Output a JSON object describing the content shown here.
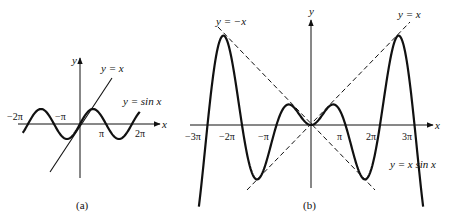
{
  "figure": {
    "panels": [
      {
        "id": "a",
        "caption": "(a)",
        "axes": {
          "x_label": "x",
          "y_label": "y"
        },
        "x_ticks": [
          "−2π",
          "−π",
          "π",
          "2π"
        ],
        "curves": [
          {
            "label": "y = sin x",
            "style": "solid-bold"
          },
          {
            "label": "y = x",
            "style": "solid"
          }
        ]
      },
      {
        "id": "b",
        "caption": "(b)",
        "axes": {
          "x_label": "x",
          "y_label": "y"
        },
        "x_ticks": [
          "−3π",
          "−2π",
          "−π",
          "π",
          "2π",
          "3π"
        ],
        "curves": [
          {
            "label": "y = x sin x",
            "style": "solid-bold"
          },
          {
            "label": "y = x",
            "style": "dashed"
          },
          {
            "label": "y = −x",
            "style": "dashed"
          }
        ]
      }
    ]
  },
  "chart_data": [
    {
      "type": "line",
      "title": "(a)",
      "xlabel": "x",
      "ylabel": "y",
      "x_ticks": [
        "−2π",
        "−π",
        "π",
        "2π"
      ],
      "series": [
        {
          "name": "y = sin x",
          "function": "sin(x)",
          "x_range": "[-2.2π, 2.3π]"
        },
        {
          "name": "y = x",
          "function": "x"
        }
      ]
    },
    {
      "type": "line",
      "title": "(b)",
      "xlabel": "x",
      "ylabel": "y",
      "x_ticks": [
        "−3π",
        "−2π",
        "−π",
        "π",
        "2π",
        "3π"
      ],
      "series": [
        {
          "name": "y = x sin x",
          "function": "x*sin(x)",
          "x_range": "[-3.3π, 3.3π]"
        },
        {
          "name": "y = x",
          "function": "x",
          "style": "dashed"
        },
        {
          "name": "y = −x",
          "function": "-x",
          "style": "dashed"
        }
      ]
    }
  ]
}
